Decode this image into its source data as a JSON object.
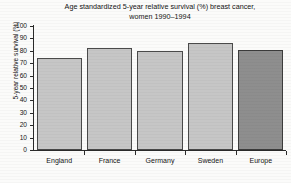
{
  "chart_data": {
    "type": "bar",
    "title": "Age standardized 5-year relative survival (%) breast cancer, women 1990–1994",
    "title_line1": "Age standardized 5-year relative survival (%) breast cancer,",
    "title_line2": "women 1990–1994",
    "categories": [
      "England",
      "France",
      "Germany",
      "Sweden",
      "Europe"
    ],
    "values": [
      74,
      82,
      80,
      86,
      81
    ],
    "series": [
      {
        "name": "5-year relative survival (%)",
        "values": [
          74,
          82,
          80,
          86,
          81
        ]
      }
    ],
    "xlabel": "",
    "ylabel": "5-year relative survival (%)",
    "ylim": [
      0,
      100
    ],
    "yticks": [
      0,
      10,
      20,
      30,
      40,
      50,
      60,
      70,
      80,
      90,
      100
    ],
    "ytick_labels": [
      "0",
      "10",
      "20",
      "30",
      "40",
      "50",
      "60",
      "70",
      "80",
      "90",
      "100"
    ],
    "grid": false,
    "legend": false,
    "legend_position": "none",
    "bar_colors": [
      "#c6c6c6",
      "#c6c6c6",
      "#c6c6c6",
      "#c6c6c6",
      "#8e8e8e"
    ],
    "highlight_category": "Europe",
    "highlight_color": "#8e8e8e",
    "bar_color": "#c6c6c6",
    "bar_edge_color": "#4a4a4a",
    "axis_color": "#2a2a2a",
    "background_color": "#fbfbfa"
  }
}
